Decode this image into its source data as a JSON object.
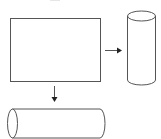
{
  "diagram": {
    "type": "shape-transformation",
    "stroke_color": "#555555",
    "arrow_color": "#222222",
    "background": "#ffffff",
    "shapes": [
      {
        "id": "rectangle",
        "kind": "rectangle",
        "x": 10,
        "y": 18,
        "width": 90,
        "height": 63
      },
      {
        "id": "vertical-cylinder",
        "kind": "cylinder",
        "orientation": "vertical",
        "x": 127,
        "y": 11,
        "width": 29,
        "height": 75
      },
      {
        "id": "horizontal-cylinder",
        "kind": "cylinder",
        "orientation": "horizontal",
        "x": 7,
        "y": 109,
        "width": 99,
        "height": 29
      }
    ],
    "arrows": [
      {
        "id": "arrow-right",
        "from": "rectangle",
        "to": "vertical-cylinder",
        "direction": "right"
      },
      {
        "id": "arrow-down",
        "from": "rectangle",
        "to": "horizontal-cylinder",
        "direction": "down"
      }
    ]
  }
}
